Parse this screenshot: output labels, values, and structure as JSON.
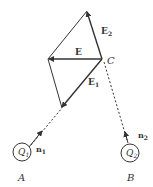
{
  "diagram": {
    "colors": {
      "stroke": "#333333",
      "background": "#ffffff"
    },
    "points": {
      "C": {
        "label": "C",
        "x": 102,
        "y": 59
      },
      "A": {
        "label": "A",
        "x": 22,
        "y": 152
      },
      "B": {
        "label": "B",
        "x": 130,
        "y": 153
      }
    },
    "charges": [
      {
        "id": "q1",
        "label": "Q",
        "subscript": "1",
        "at": "A"
      },
      {
        "id": "q2",
        "label": "Q",
        "subscript": "2",
        "at": "B"
      }
    ],
    "vectors": [
      {
        "id": "E",
        "label": "E",
        "subscript": ""
      },
      {
        "id": "E1",
        "label": "E",
        "subscript": "1"
      },
      {
        "id": "E2",
        "label": "E",
        "subscript": "2"
      }
    ],
    "unit_vectors": [
      {
        "id": "n1",
        "label": "n",
        "subscript": "1"
      },
      {
        "id": "n2",
        "label": "n",
        "subscript": "2"
      }
    ]
  }
}
